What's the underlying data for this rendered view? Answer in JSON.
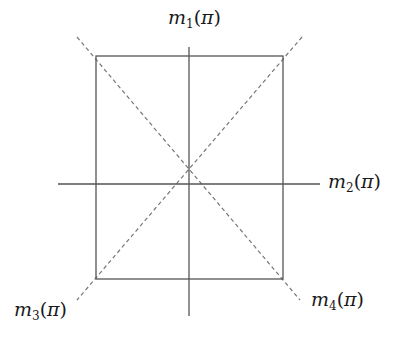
{
  "diagram": {
    "type": "symmetry-axes-of-square",
    "colors": {
      "background": "#ffffff",
      "square_stroke": "#555555",
      "axis_stroke": "#555555",
      "diagonal_stroke": "#777777",
      "label_color": "#1a1a1a"
    },
    "square": {
      "x": 96,
      "y": 56,
      "width": 187,
      "height": 223
    },
    "center": {
      "x": 189,
      "y": 184
    },
    "axes": {
      "vertical": {
        "x": 189,
        "y1": 47,
        "y2": 316
      },
      "horizontal": {
        "y": 184,
        "x1": 58,
        "x2": 320
      }
    },
    "diagonals": [
      {
        "x1": 77,
        "y1": 37,
        "x2": 300,
        "y2": 300
      },
      {
        "x1": 302,
        "y1": 37,
        "x2": 77,
        "y2": 300
      }
    ],
    "labels": [
      {
        "id": "m1",
        "base": "m",
        "sub": "1",
        "arg": "π",
        "x": 168,
        "y": 8
      },
      {
        "id": "m2",
        "base": "m",
        "sub": "2",
        "arg": "π",
        "x": 328,
        "y": 172
      },
      {
        "id": "m3",
        "base": "m",
        "sub": "3",
        "arg": "π",
        "x": 14,
        "y": 300
      },
      {
        "id": "m4",
        "base": "m",
        "sub": "4",
        "arg": "π",
        "x": 311,
        "y": 290
      }
    ]
  }
}
